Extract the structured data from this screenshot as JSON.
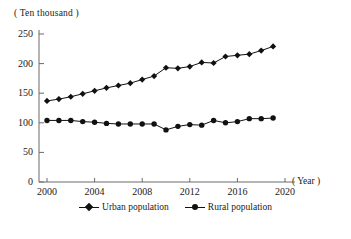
{
  "chart_data": {
    "type": "line",
    "title": "",
    "xlabel": "( Year )",
    "ylabel": "( Ten thousand )",
    "x": [
      2000,
      2001,
      2002,
      2003,
      2004,
      2005,
      2006,
      2007,
      2008,
      2009,
      2010,
      2011,
      2012,
      2013,
      2014,
      2015,
      2016,
      2017,
      2018,
      2019
    ],
    "xlim": [
      2000,
      2020
    ],
    "ylim": [
      0,
      250
    ],
    "xticks": [
      "2000",
      "2004",
      "2008",
      "2012",
      "2016",
      "2020"
    ],
    "xtick_values": [
      2000,
      2004,
      2008,
      2012,
      2016,
      2020
    ],
    "yticks": [
      "0",
      "50",
      "100",
      "150",
      "200",
      "250"
    ],
    "ytick_values": [
      0,
      50,
      100,
      150,
      200,
      250
    ],
    "grid": false,
    "legend_position": "bottom",
    "series": [
      {
        "name": "Urban population",
        "marker": "diamond",
        "color": "#111111",
        "values": [
          137,
          140,
          144,
          149,
          154,
          159,
          163,
          167,
          173,
          179,
          193,
          192,
          195,
          202,
          201,
          212,
          214,
          216,
          222,
          229
        ]
      },
      {
        "name": "Rural population",
        "marker": "circle",
        "color": "#111111",
        "values": [
          104,
          104,
          104,
          102,
          101,
          99,
          98,
          98,
          98,
          98,
          88,
          94,
          97,
          96,
          104,
          100,
          102,
          107,
          107,
          108
        ]
      }
    ]
  }
}
